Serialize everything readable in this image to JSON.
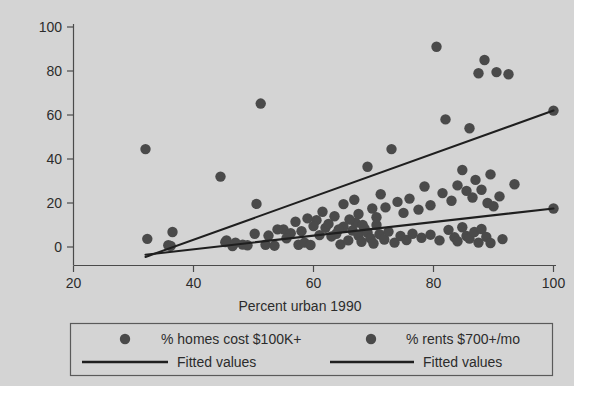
{
  "chart_data": {
    "type": "scatter",
    "title": "",
    "xlabel": "Percent urban 1990",
    "ylabel": "",
    "xlim": [
      20,
      100
    ],
    "ylim": [
      -8,
      104
    ],
    "xticks": [
      20,
      40,
      60,
      80,
      100
    ],
    "yticks": [
      0,
      20,
      40,
      60,
      80,
      100
    ],
    "xtick_labels": [
      "20",
      "40",
      "60",
      "80",
      "100"
    ],
    "ytick_labels": [
      "0",
      "20",
      "40",
      "60",
      "80",
      "100"
    ],
    "grid": false,
    "legend_position": "below-axes",
    "marker_color": "#4a4a4a",
    "line_color": "#1f1f1f",
    "background_color": "#d4d4d4",
    "series": [
      {
        "name": "% homes cost $100K+",
        "marker": "filled-circle",
        "points": [
          [
            32.0,
            44.5
          ],
          [
            32.3,
            3.7
          ],
          [
            35.8,
            0.8
          ],
          [
            36.5,
            6.8
          ],
          [
            44.5,
            32.0
          ],
          [
            45.3,
            2.2
          ],
          [
            46.5,
            0.4
          ],
          [
            48.2,
            1.1
          ],
          [
            49.0,
            0.8
          ],
          [
            50.5,
            19.6
          ],
          [
            51.2,
            65.2
          ],
          [
            52.0,
            1.0
          ],
          [
            53.5,
            0.6
          ],
          [
            55.0,
            8.0
          ],
          [
            56.2,
            6.3
          ],
          [
            57.5,
            1.0
          ],
          [
            58.5,
            2.0
          ],
          [
            59.5,
            0.9
          ],
          [
            60.5,
            12.2
          ],
          [
            61.0,
            5.4
          ],
          [
            62.0,
            8.7
          ],
          [
            63.0,
            4.8
          ],
          [
            63.8,
            6.0
          ],
          [
            64.5,
            1.2
          ],
          [
            65.0,
            9.2
          ],
          [
            65.8,
            3.0
          ],
          [
            66.5,
            7.5
          ],
          [
            67.0,
            11.0
          ],
          [
            67.5,
            5.2
          ],
          [
            68.0,
            2.4
          ],
          [
            68.5,
            8.4
          ],
          [
            69.0,
            6.6
          ],
          [
            69.5,
            4.0
          ],
          [
            70.0,
            1.6
          ],
          [
            70.5,
            10.0
          ],
          [
            71.0,
            5.8
          ],
          [
            71.8,
            3.4
          ],
          [
            72.5,
            7.0
          ],
          [
            73.5,
            2.0
          ],
          [
            74.5,
            5.0
          ],
          [
            75.5,
            3.2
          ],
          [
            76.5,
            6.0
          ],
          [
            78.0,
            4.2
          ],
          [
            79.5,
            5.6
          ],
          [
            81.0,
            3.0
          ],
          [
            82.5,
            7.8
          ],
          [
            83.5,
            4.4
          ],
          [
            84.0,
            2.6
          ],
          [
            84.8,
            9.0
          ],
          [
            85.5,
            5.0
          ],
          [
            86.0,
            3.8
          ],
          [
            86.8,
            6.8
          ],
          [
            87.5,
            2.0
          ],
          [
            88.0,
            8.2
          ],
          [
            88.8,
            4.6
          ],
          [
            89.5,
            1.8
          ],
          [
            91.5,
            3.6
          ],
          [
            100.0,
            17.5
          ]
        ],
        "fit": {
          "name": "Fitted values",
          "x": [
            32.0,
            100.0
          ],
          "y": [
            -3.5,
            17.5
          ]
        }
      },
      {
        "name": "% rents $700+/mo",
        "marker": "filled-circle",
        "points": [
          [
            36.2,
            0.5
          ],
          [
            45.5,
            3.0
          ],
          [
            47.0,
            2.0
          ],
          [
            50.2,
            6.0
          ],
          [
            52.5,
            5.2
          ],
          [
            54.0,
            8.0
          ],
          [
            55.5,
            4.0
          ],
          [
            57.0,
            11.5
          ],
          [
            58.0,
            7.2
          ],
          [
            59.0,
            13.0
          ],
          [
            60.0,
            9.5
          ],
          [
            61.5,
            16.0
          ],
          [
            62.5,
            10.5
          ],
          [
            63.5,
            14.0
          ],
          [
            64.2,
            8.0
          ],
          [
            65.0,
            19.5
          ],
          [
            66.0,
            12.5
          ],
          [
            66.8,
            21.5
          ],
          [
            67.5,
            15.0
          ],
          [
            68.2,
            10.0
          ],
          [
            69.0,
            36.5
          ],
          [
            69.8,
            17.5
          ],
          [
            70.5,
            13.5
          ],
          [
            71.2,
            24.0
          ],
          [
            72.0,
            18.0
          ],
          [
            73.0,
            44.5
          ],
          [
            74.0,
            20.5
          ],
          [
            75.0,
            15.5
          ],
          [
            76.0,
            22.0
          ],
          [
            77.5,
            17.0
          ],
          [
            78.5,
            27.5
          ],
          [
            79.5,
            19.0
          ],
          [
            80.5,
            91.0
          ],
          [
            81.5,
            24.5
          ],
          [
            82.0,
            58.0
          ],
          [
            83.0,
            21.0
          ],
          [
            84.0,
            28.0
          ],
          [
            84.8,
            35.0
          ],
          [
            85.5,
            25.5
          ],
          [
            86.0,
            54.0
          ],
          [
            86.5,
            22.5
          ],
          [
            87.0,
            30.5
          ],
          [
            87.5,
            79.0
          ],
          [
            88.0,
            26.0
          ],
          [
            88.5,
            85.0
          ],
          [
            89.0,
            20.0
          ],
          [
            89.5,
            33.0
          ],
          [
            90.0,
            18.5
          ],
          [
            90.5,
            79.5
          ],
          [
            91.0,
            23.0
          ],
          [
            92.5,
            78.5
          ],
          [
            93.5,
            28.5
          ],
          [
            100.0,
            62.0
          ]
        ],
        "fit": {
          "name": "Fitted values",
          "x": [
            32.0,
            100.0
          ],
          "y": [
            -4.5,
            62.0
          ]
        }
      }
    ]
  },
  "legend": {
    "entries": [
      {
        "marker_label": "% homes cost $100K+",
        "line_label": "Fitted values"
      },
      {
        "marker_label": "% rents $700+/mo",
        "line_label": "Fitted values"
      }
    ]
  },
  "axis": {
    "x_title": "Percent urban 1990"
  }
}
